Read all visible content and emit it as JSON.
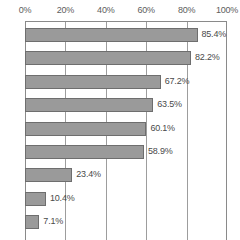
{
  "chart_data": {
    "type": "bar",
    "orientation": "horizontal",
    "title": "",
    "xlabel": "",
    "ylabel": "",
    "xlim": [
      0,
      100
    ],
    "grid": true,
    "legend": false,
    "x_unit": "%",
    "xticks": [
      "0%",
      "20%",
      "40%",
      "60%",
      "80%",
      "100%"
    ],
    "xtick_values": [
      0,
      20,
      40,
      60,
      80,
      100
    ],
    "categories": [
      "",
      "",
      "",
      "",
      "",
      "",
      "",
      "",
      ""
    ],
    "categories_note": "axis category labels are cut off at the left edge of the screenshot",
    "values": [
      85.4,
      82.2,
      67.2,
      63.5,
      60.1,
      58.9,
      23.4,
      10.4,
      7.1
    ],
    "data_labels": [
      "85.4%",
      "82.2%",
      "67.2%",
      "63.5%",
      "60.1%",
      "58.9%",
      "23.4%",
      "10.4%",
      "7.1%"
    ],
    "bar_color": "#9a9a9a",
    "bar_border_color": "#6e6e6e",
    "gridline_color": "#9d9d9d",
    "text_color": "#4a4a4a",
    "background": "#ffffff"
  }
}
